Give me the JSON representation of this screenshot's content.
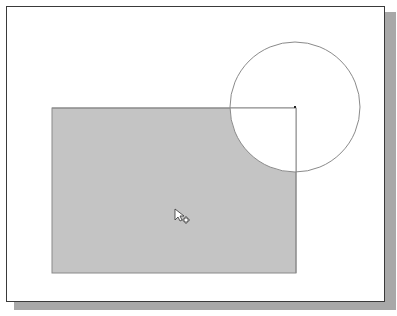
{
  "canvas": {
    "background": "#ffffff",
    "border_color": "#3a3a3a",
    "shadow_color": "#a8a8a8"
  },
  "shapes": {
    "rectangle": {
      "x": 52,
      "y": 108,
      "width": 244,
      "height": 165,
      "fill": "#c4c4c4",
      "stroke": "#8a8a8a"
    },
    "circle": {
      "cx": 295,
      "cy": 107,
      "r": 65,
      "fill": "none",
      "stroke": "#8a8a8a"
    },
    "center_point": {
      "x": 295,
      "y": 107
    }
  },
  "cursor": {
    "type": "pointer-with-plus-icon",
    "x": 175,
    "y": 210
  }
}
